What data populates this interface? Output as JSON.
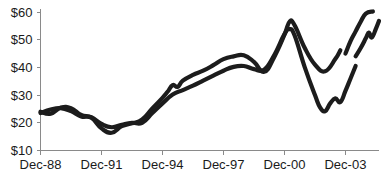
{
  "chart_data": {
    "type": "line",
    "title": "",
    "subtitle": "",
    "xlabel": "",
    "ylabel": "",
    "xlim": [
      1988.95,
      2005.6
    ],
    "ylim": [
      10,
      60
    ],
    "grid": false,
    "legend": "none",
    "y_ticks": [
      10,
      20,
      30,
      40,
      50,
      60
    ],
    "y_tick_labels": [
      "$10",
      "$20",
      "$30",
      "$40",
      "$50",
      "$60"
    ],
    "x_ticks": [
      1988.95,
      1991.95,
      1994.95,
      1997.95,
      2000.95,
      2003.95
    ],
    "x_tick_labels": [
      "Dec-88",
      "Dec-91",
      "Dec-94",
      "Dec-97",
      "Dec-00",
      "Dec-03"
    ],
    "series": [
      {
        "name": "series-1",
        "color": "#1c1c1c",
        "points": [
          [
            1988.95,
            24.0
          ],
          [
            1989.45,
            23.3
          ],
          [
            1989.95,
            25.5
          ],
          [
            1990.45,
            25.3
          ],
          [
            1990.95,
            22.8
          ],
          [
            1991.45,
            22.0
          ],
          [
            1991.95,
            19.6
          ],
          [
            1992.45,
            18.4
          ],
          [
            1992.95,
            19.3
          ],
          [
            1993.45,
            20.0
          ],
          [
            1993.95,
            20.0
          ],
          [
            1994.45,
            23.5
          ],
          [
            1994.95,
            27.0
          ],
          [
            1995.45,
            30.2
          ],
          [
            1995.95,
            31.8
          ],
          [
            1996.45,
            33.4
          ],
          [
            1996.95,
            35.2
          ],
          [
            1997.45,
            37.0
          ],
          [
            1997.95,
            38.8
          ],
          [
            1998.45,
            40.2
          ],
          [
            1998.95,
            40.5
          ],
          [
            1999.45,
            39.4
          ],
          [
            1999.95,
            39.2
          ],
          [
            2000.45,
            44.5
          ],
          [
            2000.95,
            52.0
          ],
          [
            2001.2,
            53.8
          ],
          [
            2001.45,
            51.5
          ],
          [
            2001.95,
            40.0
          ],
          [
            2002.45,
            30.0
          ],
          [
            2002.7,
            25.6
          ],
          [
            2002.95,
            24.2
          ],
          [
            2003.2,
            27.0
          ],
          [
            2003.45,
            28.8
          ],
          [
            2003.7,
            27.5
          ],
          [
            2003.95,
            31.5
          ],
          [
            2004.2,
            36.0
          ],
          [
            2004.45,
            40.5
          ]
        ]
      },
      {
        "name": "series-2",
        "color": "#1c1c1c",
        "points": [
          [
            1988.95,
            23.5
          ],
          [
            1989.45,
            24.8
          ],
          [
            1989.95,
            25.3
          ],
          [
            1990.45,
            24.2
          ],
          [
            1990.95,
            22.3
          ],
          [
            1991.45,
            21.8
          ],
          [
            1991.95,
            18.0
          ],
          [
            1992.45,
            16.4
          ],
          [
            1992.95,
            18.8
          ],
          [
            1993.45,
            19.8
          ],
          [
            1993.95,
            21.2
          ],
          [
            1994.45,
            25.2
          ],
          [
            1994.95,
            29.0
          ],
          [
            1995.2,
            31.2
          ],
          [
            1995.45,
            33.6
          ],
          [
            1995.7,
            33.0
          ],
          [
            1995.95,
            35.2
          ],
          [
            1996.45,
            37.3
          ],
          [
            1996.95,
            38.8
          ],
          [
            1997.45,
            40.8
          ],
          [
            1997.95,
            43.0
          ],
          [
            1998.45,
            44.0
          ],
          [
            1998.95,
            44.4
          ],
          [
            1999.45,
            42.0
          ],
          [
            1999.95,
            38.4
          ],
          [
            2000.45,
            43.8
          ],
          [
            2000.95,
            51.8
          ],
          [
            2001.2,
            56.5
          ],
          [
            2001.45,
            55.2
          ],
          [
            2001.95,
            47.0
          ],
          [
            2002.45,
            41.0
          ],
          [
            2002.95,
            38.6
          ],
          [
            2003.45,
            43.0
          ],
          [
            2003.7,
            46.2
          ]
        ]
      },
      {
        "name": "series-2-continued",
        "color": "#1c1c1c",
        "points": [
          [
            2003.95,
            45.0
          ],
          [
            2004.2,
            49.5
          ],
          [
            2004.45,
            53.0
          ],
          [
            2004.7,
            56.5
          ],
          [
            2004.95,
            59.4
          ],
          [
            2005.3,
            60.2
          ]
        ]
      },
      {
        "name": "series-1-continued",
        "color": "#1c1c1c",
        "points": [
          [
            2004.45,
            44.0
          ],
          [
            2004.7,
            47.0
          ],
          [
            2004.95,
            50.5
          ],
          [
            2005.1,
            52.6
          ],
          [
            2005.25,
            50.8
          ],
          [
            2005.45,
            54.0
          ],
          [
            2005.6,
            56.8
          ]
        ]
      }
    ]
  },
  "axes": {
    "y_axis_name": "dollar-value-axis",
    "x_axis_name": "date-axis"
  }
}
